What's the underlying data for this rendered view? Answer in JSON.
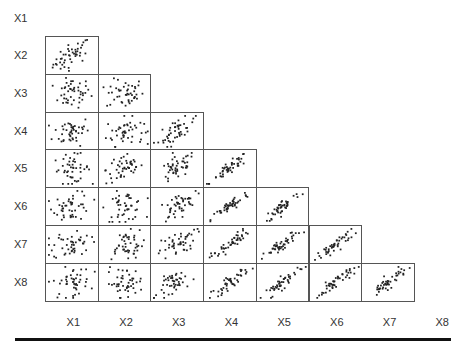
{
  "chart_data": {
    "type": "scatter",
    "title": "",
    "layout": "lower-triangular scatterplot matrix",
    "variables": [
      "X1",
      "X2",
      "X3",
      "X4",
      "X5",
      "X6",
      "X7",
      "X8"
    ],
    "row_labels": [
      "X1",
      "X2",
      "X3",
      "X4",
      "X5",
      "X6",
      "X7",
      "X8"
    ],
    "col_labels": [
      "X1",
      "X2",
      "X3",
      "X4",
      "X5",
      "X6",
      "X7",
      "X8"
    ],
    "grid": false,
    "legend": "none",
    "axes_ticks": "none",
    "panels_note": "Panel (row Xi, col Xj) for j<i; points are qualitative approximations",
    "correlation_pattern": {
      "X1": {
        "X2": "moderate positive",
        "X3": "weak",
        "X4": "weak",
        "X5": "weak",
        "X6": "weak",
        "X7": "weak",
        "X8": "weak"
      },
      "X2": {
        "X3": "weak",
        "X4": "weak",
        "X5": "weak",
        "X6": "weak",
        "X7": "weak",
        "X8": "weak"
      },
      "X3": {
        "X4": "moderate positive",
        "X5": "moderate positive",
        "X6": "moderate positive",
        "X7": "moderate positive",
        "X8": "moderate positive"
      },
      "X4": {
        "X5": "strong positive",
        "X6": "strong positive",
        "X7": "strong positive",
        "X8": "strong positive"
      },
      "X5": {
        "X6": "strong positive",
        "X7": "strong positive",
        "X8": "strong positive"
      },
      "X6": {
        "X7": "strong positive",
        "X8": "strong positive"
      },
      "X7": {
        "X8": "strong positive"
      }
    }
  },
  "geometry": {
    "left": 45,
    "top": 36,
    "cell_w": 52.7,
    "cell_h": 37.8,
    "n_points": 45
  }
}
